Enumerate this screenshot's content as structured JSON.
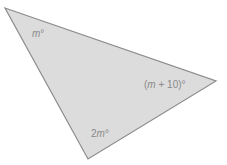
{
  "diagram": {
    "type": "triangle",
    "fill_color": "#dcdcdc",
    "stroke_color": "#8c8c8c",
    "label_color": "#8a8a8a",
    "vertices": {
      "top_left": [
        5,
        8
      ],
      "right": [
        216,
        81
      ],
      "bottom": [
        88,
        159
      ]
    },
    "angles": [
      {
        "vertex": "top_left",
        "label": "m°",
        "var": "m",
        "suffix": "°"
      },
      {
        "vertex": "right",
        "label": "(m + 10)°",
        "prefix": "(",
        "var": "m",
        "suffix": " + 10)°"
      },
      {
        "vertex": "bottom",
        "label": "2m°",
        "prefix": "2",
        "var": "m",
        "suffix": "°"
      }
    ]
  }
}
